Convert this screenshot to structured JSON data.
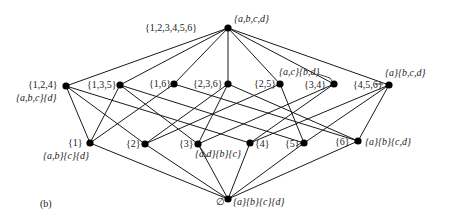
{
  "figure": {
    "panel_label": "(b)"
  },
  "nodes": [
    {
      "id": "top",
      "x": 228,
      "y": 28,
      "set_label": "{1,2,3,4,5,6}",
      "partition_label": "{a,b,c,d}"
    },
    {
      "id": "n124",
      "x": 66,
      "y": 86,
      "set_label": "{1,2,4}",
      "partition_label": "{a,b,c}{d}"
    },
    {
      "id": "n135",
      "x": 120,
      "y": 85,
      "set_label": "{1,3,5}",
      "partition_label": ""
    },
    {
      "id": "n16",
      "x": 174,
      "y": 84,
      "set_label": "{1,6}",
      "partition_label": ""
    },
    {
      "id": "n236",
      "x": 228,
      "y": 84,
      "set_label": "{2,3,6}",
      "partition_label": ""
    },
    {
      "id": "n25",
      "x": 280,
      "y": 84,
      "set_label": "{2,5}",
      "partition_label": ""
    },
    {
      "id": "n34",
      "x": 334,
      "y": 84,
      "set_label": "{3,4}",
      "partition_label": "{a,c}{b,d}"
    },
    {
      "id": "n456",
      "x": 389,
      "y": 85,
      "set_label": "{4,5,6}",
      "partition_label": "{a}{b,c,d}"
    },
    {
      "id": "n1",
      "x": 90,
      "y": 143,
      "set_label": "{1}",
      "partition_label": "{a,b}{c}{d}"
    },
    {
      "id": "n2",
      "x": 145,
      "y": 144,
      "set_label": "{2}",
      "partition_label": ""
    },
    {
      "id": "n3",
      "x": 198,
      "y": 144,
      "set_label": "{3}",
      "partition_label": "{a,d}{b}{c}"
    },
    {
      "id": "n4",
      "x": 250,
      "y": 143,
      "set_label": "{4}",
      "partition_label": ""
    },
    {
      "id": "n5",
      "x": 304,
      "y": 143,
      "set_label": "{5}",
      "partition_label": ""
    },
    {
      "id": "n6",
      "x": 358,
      "y": 141,
      "set_label": "{6}",
      "partition_label": "{a}{b}{c,d}"
    },
    {
      "id": "bottom",
      "x": 228,
      "y": 199,
      "set_label": "∅",
      "partition_label": "{a}{b}{c}{d}"
    }
  ],
  "labels": {
    "top_set": "{1,2,3,4,5,6}",
    "top_partition": "{a,b,c,d}",
    "n124_set": "{1,2,4}",
    "n124_partition": "{a,b,c}{d}",
    "n135_set": "{1,3,5}",
    "n16_set": "{1,6}",
    "n236_set": "{2,3,6}",
    "n25_set": "{2,5}",
    "n34_set": "{3,4}",
    "n34_partition": "{a,c}{b,d}",
    "n456_set": "{4,5,6}",
    "n456_partition": "{a}{b,c,d}",
    "n1_set": "{1}",
    "n1_partition": "{a,b}{c}{d}",
    "n2_set": "{2}",
    "n3_set": "{3}",
    "n3_partition": "{a,d}{b}{c}",
    "n4_set": "{4}",
    "n5_set": "{5}",
    "n6_set": "{6}",
    "n6_partition": "{a}{b}{c,d}",
    "bottom_set": "∅",
    "bottom_partition": "{a}{b}{c}{d}"
  },
  "edges": [
    [
      "top",
      "n124"
    ],
    [
      "top",
      "n135"
    ],
    [
      "top",
      "n16"
    ],
    [
      "top",
      "n236"
    ],
    [
      "top",
      "n25"
    ],
    [
      "top",
      "n34"
    ],
    [
      "top",
      "n456"
    ],
    [
      "n124",
      "n1"
    ],
    [
      "n124",
      "n2"
    ],
    [
      "n124",
      "n4"
    ],
    [
      "n135",
      "n1"
    ],
    [
      "n135",
      "n3"
    ],
    [
      "n135",
      "n5"
    ],
    [
      "n16",
      "n1"
    ],
    [
      "n16",
      "n6"
    ],
    [
      "n236",
      "n2"
    ],
    [
      "n236",
      "n3"
    ],
    [
      "n236",
      "n6"
    ],
    [
      "n25",
      "n2"
    ],
    [
      "n25",
      "n5"
    ],
    [
      "n34",
      "n3"
    ],
    [
      "n34",
      "n4"
    ],
    [
      "n456",
      "n4"
    ],
    [
      "n456",
      "n5"
    ],
    [
      "n456",
      "n6"
    ],
    [
      "n1",
      "bottom"
    ],
    [
      "n2",
      "bottom"
    ],
    [
      "n3",
      "bottom"
    ],
    [
      "n4",
      "bottom"
    ],
    [
      "n5",
      "bottom"
    ],
    [
      "n6",
      "bottom"
    ]
  ]
}
